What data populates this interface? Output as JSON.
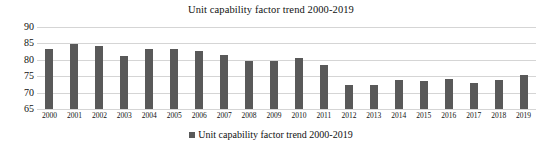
{
  "chart_data": {
    "type": "bar",
    "title": "Unit capability factor trend 2000-2019",
    "xlabel": "",
    "ylabel": "",
    "ylim": [
      65,
      90
    ],
    "yticks": [
      65,
      70,
      75,
      80,
      85,
      90
    ],
    "grid": true,
    "legend_position": "bottom",
    "categories": [
      "2000",
      "2001",
      "2002",
      "2003",
      "2004",
      "2005",
      "2006",
      "2007",
      "2008",
      "2009",
      "2010",
      "2011",
      "2012",
      "2013",
      "2014",
      "2015",
      "2016",
      "2017",
      "2018",
      "2019"
    ],
    "series": [
      {
        "name": "Unit capability factor trend 2000-2019",
        "color": "#595959",
        "values": [
          83.3,
          84.8,
          84.2,
          81.1,
          83.3,
          83.2,
          82.8,
          81.5,
          79.7,
          79.7,
          80.5,
          78.3,
          72.3,
          72.4,
          73.9,
          73.6,
          74.2,
          73.0,
          73.7,
          75.3
        ]
      }
    ]
  },
  "legend": {
    "items": [
      {
        "label": "Unit capability factor trend 2000-2019",
        "color": "#595959"
      }
    ]
  },
  "colors": {
    "bar": "#595959",
    "gridline": "#d5d5d5",
    "text": "#111111",
    "background": "#ffffff"
  }
}
